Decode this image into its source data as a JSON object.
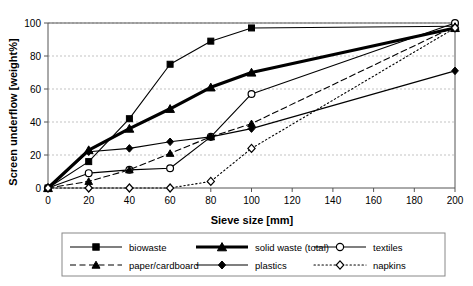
{
  "chart_data": {
    "type": "line",
    "title": "",
    "xlabel": "Sieve size [mm]",
    "ylabel": "Screen underflow [weight%]",
    "xlim": [
      0,
      200
    ],
    "ylim": [
      0,
      100
    ],
    "xticks": [
      0,
      20,
      40,
      60,
      80,
      100,
      120,
      140,
      160,
      180,
      200
    ],
    "yticks": [
      0,
      20,
      40,
      60,
      80,
      100
    ],
    "grid": "horizontal-dashed",
    "legend_position": "bottom-outside",
    "x": [
      0,
      20,
      40,
      60,
      80,
      100,
      200
    ],
    "series": [
      {
        "name": "biowaste",
        "marker": "filled-square",
        "line_style": "solid",
        "line_weight": "thin",
        "values": [
          0,
          16,
          42,
          75,
          89,
          97,
          98
        ]
      },
      {
        "name": "solid waste (total)",
        "marker": "filled-triangle",
        "line_style": "solid",
        "line_weight": "thick",
        "values": [
          0,
          23,
          36,
          48,
          61,
          70,
          97
        ]
      },
      {
        "name": "textiles",
        "marker": "open-circle",
        "line_style": "solid",
        "line_weight": "thin",
        "values": [
          0,
          9,
          11,
          12,
          31,
          57,
          100
        ]
      },
      {
        "name": "paper/cardboard",
        "marker": "filled-triangle",
        "line_style": "dashed",
        "line_weight": "thin",
        "values": [
          0,
          4,
          11,
          21,
          31,
          39,
          98
        ]
      },
      {
        "name": "plastics",
        "marker": "filled-diamond",
        "line_style": "solid",
        "line_weight": "thin",
        "values": [
          0,
          22,
          24,
          28,
          31,
          36,
          71
        ]
      },
      {
        "name": "napkins",
        "marker": "open-diamond",
        "line_style": "dotted",
        "line_weight": "thin",
        "values": [
          0,
          0,
          0,
          0,
          4,
          24,
          97
        ]
      }
    ],
    "colors": {
      "line": "#000000",
      "grid": "#aaaaaa",
      "axis": "#555555",
      "background": "#ffffff"
    }
  },
  "legend": {
    "entries": [
      {
        "label": "biowaste"
      },
      {
        "label": "solid waste (total)"
      },
      {
        "label": "textiles"
      },
      {
        "label": "paper/cardboard"
      },
      {
        "label": "plastics"
      },
      {
        "label": "napkins"
      }
    ]
  }
}
